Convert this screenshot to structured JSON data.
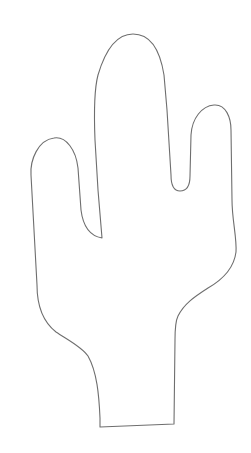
{
  "figure": {
    "description": "Line drawing outline of a saguaro cactus with three arms",
    "background_color": "#ffffff",
    "stroke_color": "#6e6e6e",
    "stroke_width": 1.1,
    "canvas": {
      "width": 251,
      "height": 453
    },
    "parts": [
      {
        "name": "left-arm",
        "top": [
          55,
          138
        ]
      },
      {
        "name": "center-arm",
        "top": [
          133,
          34
        ]
      },
      {
        "name": "right-arm",
        "top": [
          213,
          105
        ]
      },
      {
        "name": "trunk-base",
        "bottom_left": [
          100,
          427
        ],
        "bottom_right": [
          174,
          424
        ]
      }
    ]
  }
}
